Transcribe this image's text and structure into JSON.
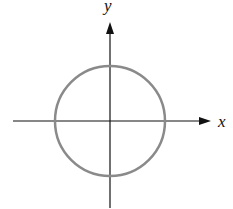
{
  "diagram": {
    "type": "circle-on-axes",
    "axes": {
      "x_label": "x",
      "y_label": "y",
      "color": "#111111"
    },
    "circle": {
      "center": [
        110,
        121
      ],
      "radius": 55,
      "stroke": "#8a8a8a"
    }
  }
}
